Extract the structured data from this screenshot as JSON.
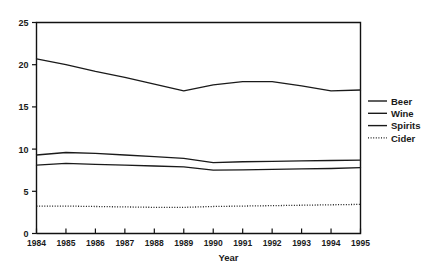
{
  "chart_data": {
    "type": "line",
    "title": "",
    "subtitle": "",
    "xlabel": "Year",
    "ylabel": "",
    "x": [
      1984,
      1985,
      1986,
      1987,
      1988,
      1989,
      1990,
      1991,
      1992,
      1993,
      1994,
      1995
    ],
    "xtick_labels": [
      "1984",
      "1985",
      "1986",
      "1987",
      "1988",
      "1989",
      "1990",
      "1991",
      "1992",
      "1993",
      "1994",
      "1995"
    ],
    "xlim": [
      1984,
      1995
    ],
    "ylim": [
      0,
      25
    ],
    "ytick_labels": [
      "0",
      "5",
      "10",
      "15",
      "20",
      "25"
    ],
    "ytick_values": [
      0,
      5,
      10,
      15,
      20,
      25
    ],
    "grid": false,
    "legend_position": "right",
    "series": [
      {
        "name": "Beer",
        "style": "solid",
        "color": "#1a1a1a",
        "values": [
          20.7,
          20.0,
          19.2,
          18.5,
          17.7,
          16.9,
          17.6,
          18.0,
          18.0,
          17.5,
          16.9,
          17.0
        ]
      },
      {
        "name": "Wine",
        "style": "solid",
        "color": "#1a1a1a",
        "values": [
          9.3,
          9.6,
          9.5,
          9.3,
          9.1,
          8.9,
          8.4,
          8.5,
          8.55,
          8.6,
          8.65,
          8.7
        ]
      },
      {
        "name": "Spirits",
        "style": "solid",
        "color": "#1a1a1a",
        "values": [
          8.1,
          8.3,
          8.2,
          8.1,
          8.0,
          7.9,
          7.5,
          7.55,
          7.6,
          7.65,
          7.7,
          7.8
        ]
      },
      {
        "name": "Cider",
        "style": "dotted",
        "color": "#1a1a1a",
        "values": [
          3.25,
          3.25,
          3.2,
          3.15,
          3.1,
          3.1,
          3.2,
          3.25,
          3.3,
          3.35,
          3.4,
          3.45
        ]
      }
    ]
  },
  "legend": {
    "entries": [
      {
        "label": "Beer",
        "style": "solid"
      },
      {
        "label": "Wine",
        "style": "solid"
      },
      {
        "label": "Spirits",
        "style": "solid"
      },
      {
        "label": "Cider",
        "style": "dotted"
      }
    ]
  },
  "axes": {
    "x_title": "Year"
  }
}
